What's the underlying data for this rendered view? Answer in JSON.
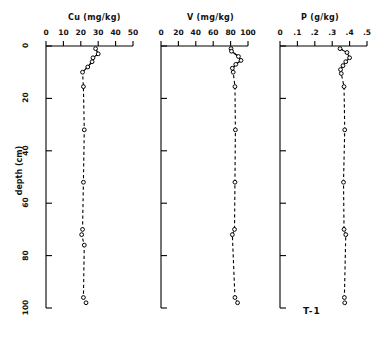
{
  "figure": {
    "label": "T-1",
    "ylabel": "depth (cm)",
    "ytick_labels": [
      "0",
      "20",
      "40",
      "60",
      "80",
      "100"
    ]
  },
  "chart_data": [
    {
      "type": "line",
      "title": "Cu (mg/kg)",
      "xlabel": "Cu (mg/kg)",
      "ylabel": "depth (cm)",
      "xlim": [
        0,
        50
      ],
      "ylim": [
        0,
        100
      ],
      "xticks": [
        0,
        10,
        20,
        30,
        40,
        50
      ],
      "xtick_labels": [
        "0",
        "10",
        "20",
        "30",
        "40",
        "50"
      ],
      "yticks": [
        0,
        20,
        40,
        60,
        80,
        100
      ],
      "ytick_labels": [
        "0",
        "20",
        "40",
        "60",
        "80",
        "100"
      ],
      "grid": false,
      "legend": "none",
      "marker": "open-circle",
      "linestyle": "dashed",
      "x": [
        28.5,
        30.0,
        27.0,
        26.5,
        24.0,
        21.0,
        21.5,
        22.0,
        21.5,
        21.0,
        20.5,
        22.0,
        21.5,
        23.0
      ],
      "y": [
        1.0,
        3.0,
        4.5,
        6.0,
        8.0,
        10.0,
        15.5,
        32.0,
        52.0,
        70.0,
        72.0,
        76.0,
        96.0,
        98.0
      ]
    },
    {
      "type": "line",
      "title": "V (mg/kg)",
      "xlabel": "V (mg/kg)",
      "ylabel": "depth (cm)",
      "xlim": [
        0,
        100
      ],
      "ylim": [
        0,
        100
      ],
      "xticks": [
        0,
        20,
        40,
        60,
        80,
        100
      ],
      "xtick_labels": [
        "0",
        "20",
        "40",
        "60",
        "80",
        "100"
      ],
      "yticks": [
        0,
        20,
        40,
        60,
        80,
        100
      ],
      "ytick_labels": [
        "0",
        "20",
        "40",
        "60",
        "80",
        "100"
      ],
      "grid": false,
      "legend": "none",
      "marker": "open-circle",
      "linestyle": "dashed",
      "x": [
        80.5,
        81.0,
        89.0,
        92.0,
        86.0,
        82.0,
        83.0,
        85.0,
        85.5,
        85.0,
        84.5,
        82.0,
        85.0,
        88.0
      ],
      "y": [
        1.0,
        2.0,
        4.0,
        5.5,
        7.0,
        8.5,
        10.0,
        15.5,
        32.0,
        52.0,
        70.0,
        72.0,
        96.0,
        98.0
      ]
    },
    {
      "type": "line",
      "title": "P (g/kg)",
      "xlabel": "P (g/kg)",
      "ylabel": "depth (cm)",
      "xlim": [
        0,
        0.5
      ],
      "ylim": [
        0,
        100
      ],
      "xticks": [
        0,
        0.1,
        0.2,
        0.3,
        0.4,
        0.5
      ],
      "xtick_labels": [
        "0",
        ".1",
        ".2",
        ".3",
        ".4",
        ".5"
      ],
      "yticks": [
        0,
        20,
        40,
        60,
        80,
        100
      ],
      "ytick_labels": [
        "0",
        "20",
        "40",
        "60",
        "80",
        "100"
      ],
      "grid": false,
      "legend": "none",
      "marker": "open-circle",
      "linestyle": "dashed",
      "x": [
        0.345,
        0.385,
        0.4,
        0.378,
        0.362,
        0.348,
        0.352,
        0.368,
        0.372,
        0.365,
        0.368,
        0.378,
        0.37,
        0.372
      ],
      "y": [
        1.0,
        2.5,
        4.5,
        6.0,
        7.5,
        9.0,
        10.5,
        15.5,
        32.0,
        52.0,
        70.0,
        72.0,
        96.0,
        98.0
      ]
    }
  ]
}
